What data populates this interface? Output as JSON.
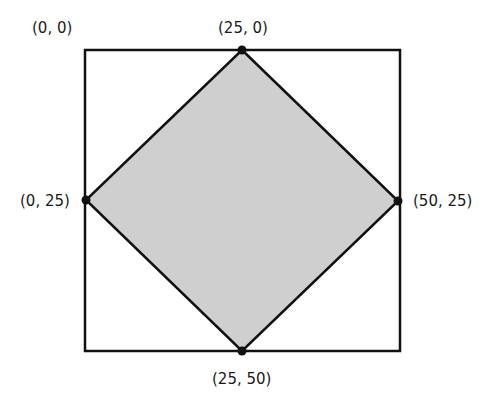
{
  "diagram": {
    "square": {
      "stroke": "#111111",
      "fill": "#ffffff"
    },
    "diamond": {
      "stroke": "#111111",
      "fill": "#cfcfcf"
    },
    "corner_label": "(0, 0)",
    "vertices": [
      {
        "id": "top",
        "label": "(25, 0)"
      },
      {
        "id": "left",
        "label": "(0, 25)"
      },
      {
        "id": "right",
        "label": "(50, 25)"
      },
      {
        "id": "bottom",
        "label": "(25, 50)"
      }
    ]
  }
}
